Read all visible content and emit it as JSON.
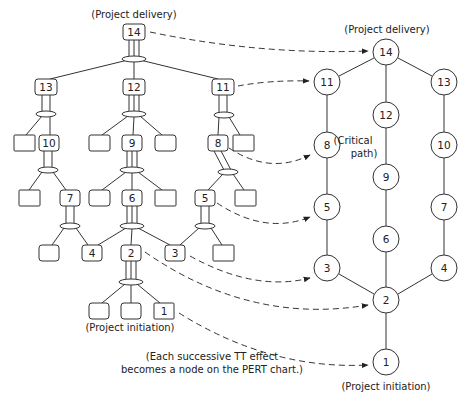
{
  "labels": {
    "left_top": "(Project delivery)",
    "left_bottom": "(Project initiation)",
    "right_top": "(Project delivery)",
    "right_bottom": "(Project initiation)",
    "critical_line1": "(Critical",
    "critical_line2": "path)",
    "note_line1": "(Each successive TT effect",
    "note_line2": "becomes a node on the PERT chart.)"
  },
  "tree": {
    "nodes": [
      {
        "id": "14",
        "label": "14",
        "x": 134,
        "y": 32
      },
      {
        "id": "13",
        "label": "13",
        "x": 46,
        "y": 87
      },
      {
        "id": "12",
        "label": "12",
        "x": 134,
        "y": 87
      },
      {
        "id": "11",
        "label": "11",
        "x": 223,
        "y": 87
      },
      {
        "id": "b1",
        "label": "",
        "x": 24,
        "y": 143
      },
      {
        "id": "10",
        "label": "10",
        "x": 49,
        "y": 143
      },
      {
        "id": "b2",
        "label": "",
        "x": 99,
        "y": 143
      },
      {
        "id": "9",
        "label": "9",
        "x": 132,
        "y": 143
      },
      {
        "id": "b3",
        "label": "",
        "x": 165,
        "y": 143
      },
      {
        "id": "8",
        "label": "8",
        "x": 218,
        "y": 143
      },
      {
        "id": "b4",
        "label": "",
        "x": 243,
        "y": 143
      },
      {
        "id": "b5",
        "label": "",
        "x": 29,
        "y": 198
      },
      {
        "id": "7",
        "label": "7",
        "x": 70,
        "y": 198
      },
      {
        "id": "b6",
        "label": "",
        "x": 99,
        "y": 198
      },
      {
        "id": "6",
        "label": "6",
        "x": 132,
        "y": 198
      },
      {
        "id": "b7",
        "label": "",
        "x": 165,
        "y": 198
      },
      {
        "id": "5",
        "label": "5",
        "x": 205,
        "y": 198
      },
      {
        "id": "b8",
        "label": "",
        "x": 245,
        "y": 198
      },
      {
        "id": "b9",
        "label": "",
        "x": 49,
        "y": 253
      },
      {
        "id": "4",
        "label": "4",
        "x": 92,
        "y": 253
      },
      {
        "id": "2",
        "label": "2",
        "x": 131,
        "y": 253
      },
      {
        "id": "3",
        "label": "3",
        "x": 175,
        "y": 253
      },
      {
        "id": "b10",
        "label": "",
        "x": 223,
        "y": 253
      },
      {
        "id": "b11",
        "label": "",
        "x": 99,
        "y": 311
      },
      {
        "id": "b12",
        "label": "",
        "x": 131,
        "y": 311
      },
      {
        "id": "1",
        "label": "1",
        "x": 164,
        "y": 311
      }
    ]
  },
  "pert": {
    "nodes": [
      {
        "id": "14",
        "label": "14",
        "x": 386,
        "y": 52
      },
      {
        "id": "11",
        "label": "11",
        "x": 327,
        "y": 82
      },
      {
        "id": "12",
        "label": "12",
        "x": 386,
        "y": 115
      },
      {
        "id": "13",
        "label": "13",
        "x": 444,
        "y": 82
      },
      {
        "id": "8",
        "label": "8",
        "x": 327,
        "y": 145
      },
      {
        "id": "9",
        "label": "9",
        "x": 386,
        "y": 177
      },
      {
        "id": "10",
        "label": "10",
        "x": 444,
        "y": 145
      },
      {
        "id": "5",
        "label": "5",
        "x": 327,
        "y": 207
      },
      {
        "id": "6",
        "label": "6",
        "x": 386,
        "y": 239
      },
      {
        "id": "7",
        "label": "7",
        "x": 444,
        "y": 207
      },
      {
        "id": "3",
        "label": "3",
        "x": 327,
        "y": 268
      },
      {
        "id": "2",
        "label": "2",
        "x": 386,
        "y": 300
      },
      {
        "id": "4",
        "label": "4",
        "x": 444,
        "y": 268
      },
      {
        "id": "1",
        "label": "1",
        "x": 386,
        "y": 362
      }
    ],
    "edges": [
      [
        "14",
        "11"
      ],
      [
        "14",
        "12"
      ],
      [
        "14",
        "13"
      ],
      [
        "11",
        "8"
      ],
      [
        "12",
        "9"
      ],
      [
        "13",
        "10"
      ],
      [
        "8",
        "5"
      ],
      [
        "9",
        "6"
      ],
      [
        "10",
        "7"
      ],
      [
        "5",
        "3"
      ],
      [
        "6",
        "2"
      ],
      [
        "7",
        "4"
      ],
      [
        "3",
        "2"
      ],
      [
        "4",
        "2"
      ],
      [
        "2",
        "1"
      ]
    ]
  },
  "mappings": [
    [
      "14",
      "14"
    ],
    [
      "11",
      "11"
    ],
    [
      "8",
      "8"
    ],
    [
      "5",
      "5"
    ],
    [
      "3",
      "3"
    ],
    [
      "2",
      "2"
    ],
    [
      "1",
      "1"
    ]
  ]
}
